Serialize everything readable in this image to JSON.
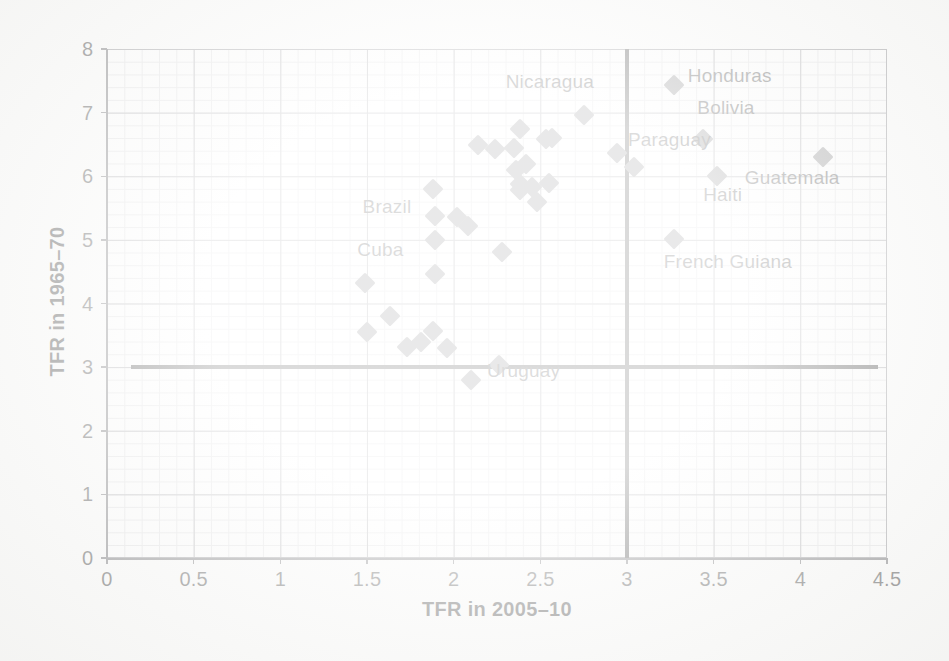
{
  "chart_data": {
    "type": "scatter",
    "title": "",
    "xlabel": "TFR in 2005–10",
    "ylabel": "TFR in 1965–70",
    "xlim": [
      0,
      4.5
    ],
    "ylim": [
      0,
      8
    ],
    "xticks": [
      "0",
      "0.5",
      "1",
      "1.5",
      "2",
      "2.5",
      "3",
      "3.5",
      "4",
      "4.5"
    ],
    "xtick_values": [
      0,
      0.5,
      1,
      1.5,
      2,
      2.5,
      3,
      3.5,
      4,
      4.5
    ],
    "yticks": [
      "0",
      "1",
      "2",
      "3",
      "4",
      "5",
      "6",
      "7",
      "8"
    ],
    "ytick_values": [
      0,
      1,
      2,
      3,
      4,
      5,
      6,
      7,
      8
    ],
    "grid": true,
    "minor_grid": true,
    "legend": "none",
    "marker": "diamond",
    "marker_color": "#6e6e70",
    "reference_lines": [
      {
        "orientation": "horizontal",
        "value": 3,
        "x_start": 0.14,
        "x_end": 4.45,
        "color": "#0d0d0d"
      },
      {
        "orientation": "vertical",
        "value": 3,
        "y_start": 0,
        "y_end": 8,
        "color": "#0d0d0d"
      }
    ],
    "points": [
      {
        "x": 1.49,
        "y": 4.32,
        "label": "Cuba",
        "label_pos": "above"
      },
      {
        "x": 1.5,
        "y": 3.55,
        "label": "",
        "label_pos": ""
      },
      {
        "x": 1.63,
        "y": 3.8,
        "label": "",
        "label_pos": ""
      },
      {
        "x": 1.73,
        "y": 3.31,
        "label": "",
        "label_pos": ""
      },
      {
        "x": 1.81,
        "y": 3.4,
        "label": "",
        "label_pos": ""
      },
      {
        "x": 1.88,
        "y": 3.56,
        "label": "",
        "label_pos": ""
      },
      {
        "x": 1.96,
        "y": 3.3,
        "label": "",
        "label_pos": ""
      },
      {
        "x": 1.88,
        "y": 5.8,
        "label": "",
        "label_pos": ""
      },
      {
        "x": 1.89,
        "y": 5.38,
        "label": "Brazil",
        "label_pos": "left"
      },
      {
        "x": 1.89,
        "y": 5.0,
        "label": "",
        "label_pos": ""
      },
      {
        "x": 1.89,
        "y": 4.46,
        "label": "",
        "label_pos": ""
      },
      {
        "x": 2.02,
        "y": 5.36,
        "label": "",
        "label_pos": ""
      },
      {
        "x": 2.08,
        "y": 5.22,
        "label": "",
        "label_pos": ""
      },
      {
        "x": 2.1,
        "y": 2.8,
        "label": "Uruguay",
        "label_pos": "right"
      },
      {
        "x": 2.26,
        "y": 3.03,
        "label": "",
        "label_pos": ""
      },
      {
        "x": 2.14,
        "y": 6.49,
        "label": "",
        "label_pos": ""
      },
      {
        "x": 2.24,
        "y": 6.43,
        "label": "",
        "label_pos": ""
      },
      {
        "x": 2.28,
        "y": 4.81,
        "label": "",
        "label_pos": ""
      },
      {
        "x": 2.35,
        "y": 6.44,
        "label": "",
        "label_pos": ""
      },
      {
        "x": 2.38,
        "y": 6.75,
        "label": "",
        "label_pos": ""
      },
      {
        "x": 2.36,
        "y": 6.1,
        "label": "",
        "label_pos": ""
      },
      {
        "x": 2.38,
        "y": 5.88,
        "label": "",
        "label_pos": ""
      },
      {
        "x": 2.38,
        "y": 5.78,
        "label": "",
        "label_pos": ""
      },
      {
        "x": 2.42,
        "y": 6.19,
        "label": "",
        "label_pos": ""
      },
      {
        "x": 2.45,
        "y": 5.83,
        "label": "",
        "label_pos": ""
      },
      {
        "x": 2.48,
        "y": 5.6,
        "label": "",
        "label_pos": ""
      },
      {
        "x": 2.53,
        "y": 6.58,
        "label": "",
        "label_pos": ""
      },
      {
        "x": 2.57,
        "y": 6.6,
        "label": "",
        "label_pos": ""
      },
      {
        "x": 2.55,
        "y": 5.9,
        "label": "",
        "label_pos": ""
      },
      {
        "x": 2.75,
        "y": 6.96,
        "label": "Nicaragua",
        "label_pos": "above-left"
      },
      {
        "x": 2.94,
        "y": 6.37,
        "label": "",
        "label_pos": ""
      },
      {
        "x": 3.04,
        "y": 6.14,
        "label": "Paraguay",
        "label_pos": "left-above"
      },
      {
        "x": 3.27,
        "y": 7.43,
        "label": "Honduras",
        "label_pos": "right"
      },
      {
        "x": 3.44,
        "y": 6.58,
        "label": "Bolivia",
        "label_pos": "above"
      },
      {
        "x": 3.52,
        "y": 6.01,
        "label": "Haiti",
        "label_pos": "below"
      },
      {
        "x": 3.27,
        "y": 5.02,
        "label": "French Guiana",
        "label_pos": "below-right"
      },
      {
        "x": 4.13,
        "y": 6.31,
        "label": "Guatemala",
        "label_pos": "below-left"
      }
    ],
    "annotations": [
      {
        "text": "Cuba",
        "x": 1.49,
        "y": 4.32,
        "dx": -8,
        "dy": -34
      },
      {
        "text": "Brazil",
        "x": 1.89,
        "y": 5.38,
        "dx": -72,
        "dy": -10
      },
      {
        "text": "Uruguay",
        "x": 2.1,
        "y": 2.8,
        "dx": 16,
        "dy": -10
      },
      {
        "text": "Nicaragua",
        "x": 2.75,
        "y": 6.96,
        "dx": -78,
        "dy": -34
      },
      {
        "text": "Paraguay",
        "x": 3.04,
        "y": 6.14,
        "dx": -6,
        "dy": -28
      },
      {
        "text": "Honduras",
        "x": 3.27,
        "y": 7.43,
        "dx": 14,
        "dy": -10
      },
      {
        "text": "Bolivia",
        "x": 3.44,
        "y": 6.58,
        "dx": -6,
        "dy": -32
      },
      {
        "text": "Haiti",
        "x": 3.52,
        "y": 6.01,
        "dx": -14,
        "dy": 18
      },
      {
        "text": "French Guiana",
        "x": 3.27,
        "y": 5.02,
        "dx": -10,
        "dy": 22
      },
      {
        "text": "Guatemala",
        "x": 4.13,
        "y": 6.31,
        "dx": -78,
        "dy": 20
      }
    ]
  }
}
